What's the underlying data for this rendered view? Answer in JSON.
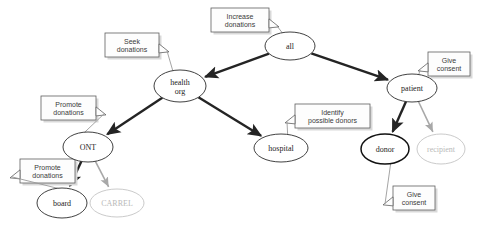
{
  "diagram": {
    "type": "node-link-graph",
    "colors": {
      "node_stroke": "#2b2b2b",
      "node_stroke_bold": "#111111",
      "node_faded": "#c4c4c4",
      "edge": "#242424",
      "edge_faded": "#a8a8a8",
      "callout_stroke": "#5f5f5f",
      "text": "#1c1c1c",
      "text_faded": "#b9b9b9",
      "background": "#ffffff"
    },
    "nodes": [
      {
        "id": "all",
        "label": "all",
        "cx": 290,
        "cy": 46,
        "rx": 25,
        "ry": 14,
        "style": "normal",
        "lines": [
          "all"
        ]
      },
      {
        "id": "health_org",
        "label": "health org",
        "cx": 180,
        "cy": 86,
        "rx": 26,
        "ry": 16,
        "style": "normal",
        "lines": [
          "health",
          "org"
        ]
      },
      {
        "id": "patient",
        "label": "patient",
        "cx": 412,
        "cy": 88,
        "rx": 25,
        "ry": 14,
        "style": "normal",
        "lines": [
          "patient"
        ]
      },
      {
        "id": "ont",
        "label": "ONT",
        "cx": 88,
        "cy": 147,
        "rx": 25,
        "ry": 15,
        "style": "normal",
        "lines": [
          "ONT"
        ]
      },
      {
        "id": "hospital",
        "label": "hospital",
        "cx": 281,
        "cy": 148,
        "rx": 27,
        "ry": 14,
        "style": "normal",
        "lines": [
          "hospital"
        ]
      },
      {
        "id": "donor",
        "label": "donor",
        "cx": 385,
        "cy": 149,
        "rx": 24,
        "ry": 15,
        "style": "bold",
        "lines": [
          "donor"
        ]
      },
      {
        "id": "recipient",
        "label": "recipient",
        "cx": 441,
        "cy": 149,
        "rx": 24,
        "ry": 15,
        "style": "faded",
        "lines": [
          "recipient"
        ]
      },
      {
        "id": "board",
        "label": "board",
        "cx": 62,
        "cy": 203,
        "rx": 25,
        "ry": 15,
        "style": "normal",
        "lines": [
          "board"
        ]
      },
      {
        "id": "carrel",
        "label": "CARREL",
        "cx": 117,
        "cy": 203,
        "rx": 27,
        "ry": 14,
        "style": "faded",
        "lines": [
          "CARREL"
        ]
      }
    ],
    "edges": [
      {
        "from": "all",
        "to": "health_org",
        "style": "solid"
      },
      {
        "from": "all",
        "to": "patient",
        "style": "solid"
      },
      {
        "from": "health_org",
        "to": "ont",
        "style": "solid"
      },
      {
        "from": "health_org",
        "to": "hospital",
        "style": "solid"
      },
      {
        "from": "patient",
        "to": "donor",
        "style": "solid"
      },
      {
        "from": "patient",
        "to": "recipient",
        "style": "faded"
      },
      {
        "from": "ont",
        "to": "board",
        "style": "solid"
      },
      {
        "from": "ont",
        "to": "carrel",
        "style": "faded"
      }
    ],
    "callouts": [
      {
        "id": "increase-donations",
        "lines": [
          "Increase",
          "donations"
        ],
        "x": 211,
        "y": 8,
        "w": 58,
        "h": 24,
        "attached_to": "all",
        "tail": "right-bottom"
      },
      {
        "id": "seek-donations",
        "lines": [
          "Seek",
          "donations"
        ],
        "x": 105,
        "y": 33,
        "w": 54,
        "h": 24,
        "attached_to": "health_org",
        "tail": "right-bottom"
      },
      {
        "id": "give-consent-patient",
        "lines": [
          "Give",
          "consent"
        ],
        "x": 428,
        "y": 52,
        "w": 42,
        "h": 24,
        "attached_to": "patient",
        "tail": "left-bottom"
      },
      {
        "id": "promote-donations-ont",
        "lines": [
          "Promote",
          "donations"
        ],
        "x": 41,
        "y": 96,
        "w": 55,
        "h": 24,
        "attached_to": "ont",
        "tail": "right-bottom"
      },
      {
        "id": "identify-possible-donors",
        "lines": [
          "Identify",
          "possible donors"
        ],
        "x": 295,
        "y": 104,
        "w": 75,
        "h": 24,
        "attached_to": "hospital",
        "tail": "left-bottom"
      },
      {
        "id": "promote-donations-board",
        "lines": [
          "Promote",
          "donations"
        ],
        "x": 20,
        "y": 159,
        "w": 55,
        "h": 24,
        "attached_to": "board",
        "tail": "left-bottom"
      },
      {
        "id": "give-consent-donor",
        "lines": [
          "Give",
          "consent"
        ],
        "x": 393,
        "y": 186,
        "w": 42,
        "h": 24,
        "attached_to": "donor",
        "tail": "left-top"
      }
    ]
  }
}
